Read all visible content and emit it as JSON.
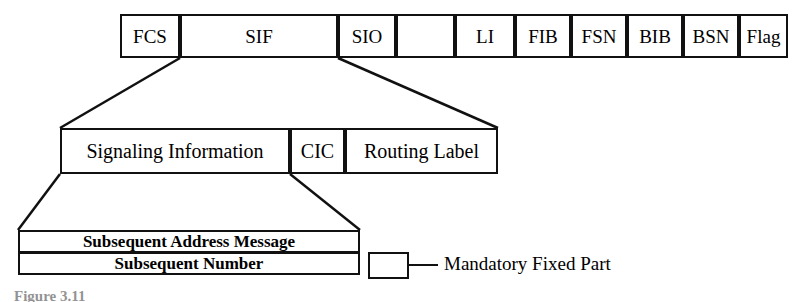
{
  "figure": {
    "caption": "Figure 3.11",
    "colors": {
      "line": "#111111",
      "background": "#ffffff"
    }
  },
  "frame_row": {
    "name": "MSU frame structure",
    "fields": [
      {
        "label": "FCS",
        "x": 120,
        "width": 60
      },
      {
        "label": "SIF",
        "x": 180,
        "width": 158
      },
      {
        "label": "SIO",
        "x": 338,
        "width": 58
      },
      {
        "label": "",
        "x": 396,
        "width": 59,
        "style": "diagonal-slash"
      },
      {
        "label": "LI",
        "x": 455,
        "width": 60
      },
      {
        "label": "FIB",
        "x": 515,
        "width": 56
      },
      {
        "label": "FSN",
        "x": 571,
        "width": 56
      },
      {
        "label": "BIB",
        "x": 627,
        "width": 56
      },
      {
        "label": "BSN",
        "x": 683,
        "width": 56
      },
      {
        "label": "Flag",
        "x": 739,
        "width": 49
      }
    ]
  },
  "sif_row": {
    "name": "SIF expansion",
    "fields": [
      {
        "label": "Signaling Information",
        "x": 60,
        "width": 230
      },
      {
        "label": "CIC",
        "x": 290,
        "width": 55
      },
      {
        "label": "Routing Label",
        "x": 345,
        "width": 153
      }
    ]
  },
  "message_row": {
    "name": "Signaling Information expansion",
    "x": 18,
    "width": 342,
    "fields": [
      {
        "label": "Subsequent Address Message"
      },
      {
        "label": "Subsequent Number"
      }
    ]
  },
  "legend": {
    "label": "Mandatory Fixed Part",
    "swatch": "empty-box"
  },
  "connectors": [
    {
      "name": "sif-to-signaling-row",
      "from_x1": 180,
      "from_x2": 338,
      "to_x1": 60,
      "to_x2": 498
    },
    {
      "name": "signaling-to-message-row",
      "from_x1": 60,
      "from_x2": 290,
      "to_x1": 18,
      "to_x2": 360
    }
  ]
}
